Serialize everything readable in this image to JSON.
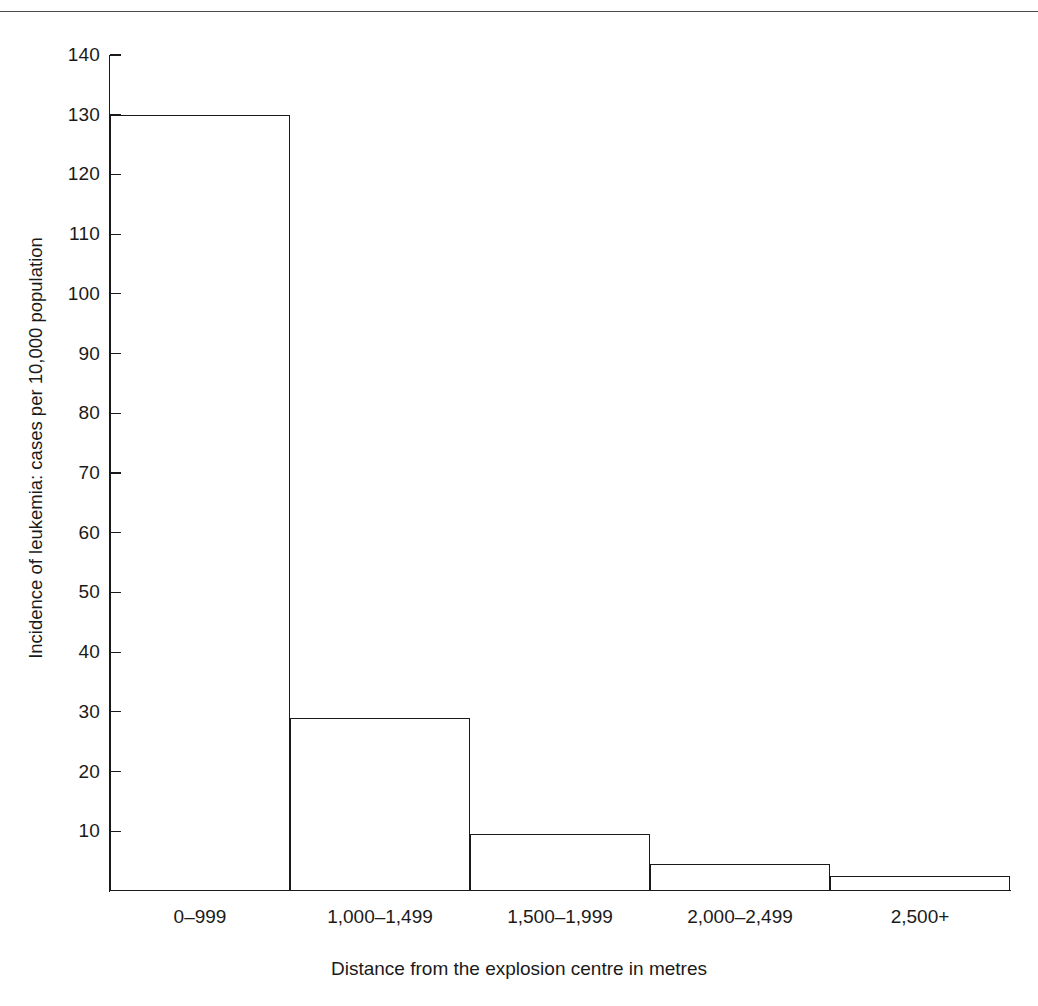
{
  "figure": {
    "background": "#ffffff",
    "line_color": "#1a1a1a",
    "rule_color": "#4a4a4a"
  },
  "chart_data": {
    "type": "bar",
    "title": "",
    "subtitle": "",
    "categories": [
      "0–999",
      "1,000–1,499",
      "1,500–1,999",
      "2,000–2,499",
      "2,500+"
    ],
    "values": [
      130,
      29,
      9.5,
      4.5,
      2.5
    ],
    "xlabel": "Distance from the explosion centre in metres",
    "ylabel": "Incidence of leukemia: cases per 10,000 population",
    "ylim": [
      0,
      140
    ],
    "yticks": [
      140,
      130,
      120,
      110,
      100,
      90,
      80,
      70,
      60,
      50,
      40,
      30,
      20,
      10
    ],
    "ytick_labels": [
      "140",
      "130",
      "120",
      "110",
      "100",
      "90",
      "80",
      "70",
      "60",
      "50",
      "40",
      "30",
      "20",
      "10"
    ],
    "grid": false,
    "legend": null,
    "bar_style": {
      "fill": "none",
      "edge_color": "#1a1a1a",
      "edge_width": 1.4,
      "gap": 0
    },
    "annotations": []
  }
}
